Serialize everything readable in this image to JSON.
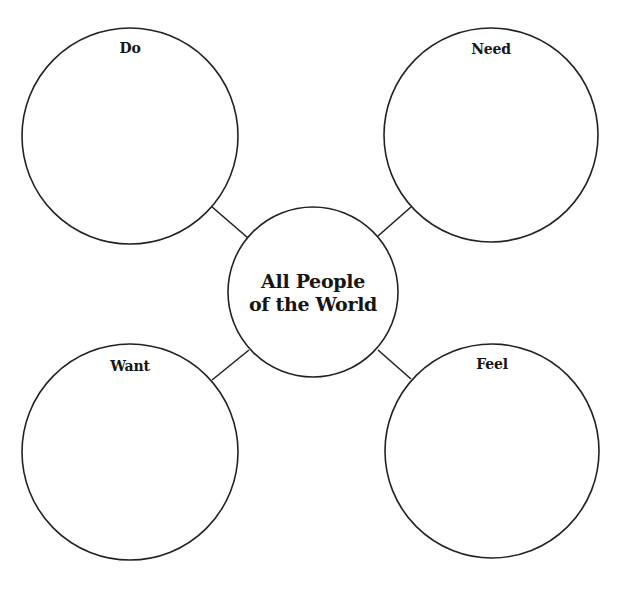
{
  "diagram": {
    "type": "concept-web",
    "center": {
      "line1": "All People",
      "line2": "of the World"
    },
    "nodes": [
      {
        "id": "do",
        "label": "Do"
      },
      {
        "id": "need",
        "label": "Need"
      },
      {
        "id": "want",
        "label": "Want"
      },
      {
        "id": "feel",
        "label": "Feel"
      }
    ],
    "colors": {
      "stroke": "#222222",
      "text": "#151515",
      "background": "#ffffff"
    }
  }
}
